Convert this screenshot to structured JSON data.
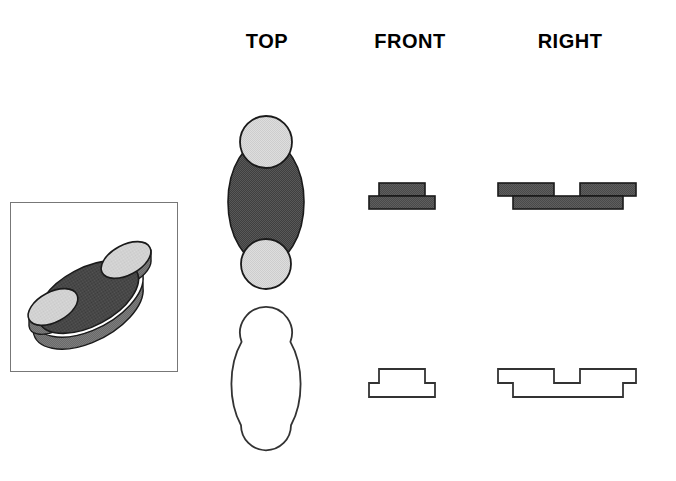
{
  "drawing": {
    "title_row": {
      "top_label": "TOP",
      "front_label": "FRONT",
      "right_label": "RIGHT"
    },
    "pictorial": {
      "name": "isometric-pictorial",
      "description": "oval base plate with two cylindrical bosses",
      "frame_color": "#777777",
      "plate_top_color": "#3f3f3f",
      "plate_side_color": "#6e6e6e",
      "boss_top_color": "#d9d9d9",
      "boss_side_color": "#8a8a8a",
      "outline_color": "#1a1a1a"
    },
    "colors": {
      "dark_fill": "#4a4a4a",
      "light_fill": "#dcdcdc",
      "mid_fill": "#6e6e6e",
      "outline": "#1a1a1a",
      "line_outline": "#333333",
      "background": "#ffffff"
    },
    "shaded_views": {
      "top": {
        "name": "top-view-shaded",
        "ellipse": {
          "cx": 265,
          "cy": 202,
          "rx": 38,
          "ry": 62
        },
        "boss_upper": {
          "cx": 265,
          "cy": 142,
          "r": 26
        },
        "boss_lower": {
          "cx": 265,
          "cy": 264,
          "r": 25
        }
      },
      "front": {
        "name": "front-view-shaded",
        "base": {
          "x": 369,
          "y": 196,
          "w": 66,
          "h": 13
        },
        "boss": {
          "x": 379,
          "y": 183,
          "w": 46,
          "h": 13
        }
      },
      "right": {
        "name": "right-view-shaded",
        "base": {
          "x": 513,
          "y": 196,
          "w": 110,
          "h": 13
        },
        "boss_left": {
          "x": 498,
          "y": 183,
          "w": 56,
          "h": 13
        },
        "boss_right": {
          "x": 580,
          "y": 183,
          "w": 56,
          "h": 13
        }
      }
    },
    "line_views": {
      "top": {
        "name": "top-view-outline",
        "ellipse": {
          "cx": 265,
          "cy": 386,
          "rx": 38,
          "ry": 62
        },
        "boss_upper": {
          "cx": 265,
          "cy": 330,
          "r": 26
        },
        "boss_lower": {
          "cx": 265,
          "cy": 443,
          "r": 25
        }
      },
      "front": {
        "name": "front-view-outline",
        "base": {
          "x": 369,
          "y": 383,
          "w": 66,
          "h": 14
        },
        "boss": {
          "x": 379,
          "y": 369,
          "w": 46,
          "h": 14
        }
      },
      "right": {
        "name": "right-view-outline",
        "base": {
          "x": 513,
          "y": 383,
          "w": 110,
          "h": 14
        },
        "boss_left": {
          "x": 498,
          "y": 369,
          "w": 56,
          "h": 14
        },
        "boss_right": {
          "x": 580,
          "y": 369,
          "w": 56,
          "h": 14
        }
      }
    }
  }
}
